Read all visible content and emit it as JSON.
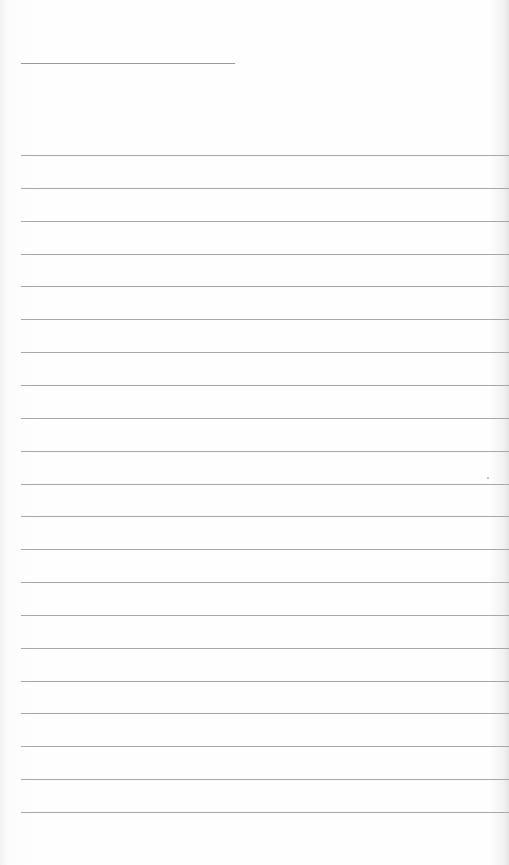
{
  "page": {
    "type": "blank lined paper",
    "background_color": "#fefefe",
    "line_color": "#a8a8a8"
  },
  "header_line": {
    "x": 21,
    "y": 63,
    "width": 214
  },
  "rules": {
    "count": 21,
    "start_y": 155,
    "spacing": 32.85,
    "x": 21
  }
}
